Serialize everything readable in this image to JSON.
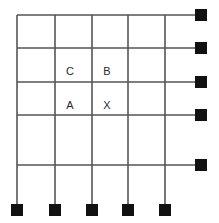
{
  "diagram": {
    "background_color": "#ffffff",
    "line_color": "#555555",
    "terminal_color": "#111111",
    "line_width": 1.6,
    "terminal_size": 12,
    "geometry": {
      "vertical_lines_x": [
        17,
        55,
        92,
        128,
        165
      ],
      "horizontal_lines_y": [
        15,
        48,
        82,
        115,
        148,
        165
      ],
      "grid_left": 17,
      "grid_right": 207,
      "grid_top": 15,
      "grid_bottom": 210
    },
    "horizontal_lines": [
      {
        "name": "row-line-1",
        "y": 15,
        "x_start": 17,
        "x_end": 201
      },
      {
        "name": "row-line-2",
        "y": 48,
        "x_start": 17,
        "x_end": 201
      },
      {
        "name": "row-line-3",
        "y": 82,
        "x_start": 17,
        "x_end": 201
      },
      {
        "name": "row-line-4",
        "y": 115,
        "x_start": 17,
        "x_end": 201
      },
      {
        "name": "row-line-5",
        "y": 165,
        "x_start": 17,
        "x_end": 201
      }
    ],
    "vertical_lines": [
      {
        "name": "column-line-1",
        "x": 17,
        "y_start": 15,
        "y_end": 204
      },
      {
        "name": "column-line-2",
        "x": 55,
        "y_start": 15,
        "y_end": 204
      },
      {
        "name": "column-line-3",
        "x": 92,
        "y_start": 15,
        "y_end": 204
      },
      {
        "name": "column-line-4",
        "x": 128,
        "y_start": 15,
        "y_end": 204
      },
      {
        "name": "column-line-5",
        "x": 165,
        "y_start": 15,
        "y_end": 204
      }
    ],
    "right_terminals": [
      {
        "name": "right-terminal-1",
        "cx": 201,
        "cy": 15
      },
      {
        "name": "right-terminal-2",
        "cx": 201,
        "cy": 48
      },
      {
        "name": "right-terminal-3",
        "cx": 201,
        "cy": 82
      },
      {
        "name": "right-terminal-4",
        "cx": 201,
        "cy": 115
      },
      {
        "name": "right-terminal-5",
        "cx": 201,
        "cy": 165
      }
    ],
    "bottom_terminals": [
      {
        "name": "bottom-terminal-1",
        "cx": 17,
        "cy": 210
      },
      {
        "name": "bottom-terminal-2",
        "cx": 55,
        "cy": 210
      },
      {
        "name": "bottom-terminal-3",
        "cx": 92,
        "cy": 210
      },
      {
        "name": "bottom-terminal-4",
        "cx": 128,
        "cy": 210
      },
      {
        "name": "bottom-terminal-5",
        "cx": 165,
        "cy": 210
      }
    ],
    "cell_labels": [
      {
        "name": "cell-label-c",
        "text": "C",
        "x": 70,
        "y": 71
      },
      {
        "name": "cell-label-b",
        "text": "B",
        "x": 107,
        "y": 71
      },
      {
        "name": "cell-label-a",
        "text": "A",
        "x": 70,
        "y": 105
      },
      {
        "name": "cell-label-x",
        "text": "X",
        "x": 107,
        "y": 105
      }
    ]
  }
}
